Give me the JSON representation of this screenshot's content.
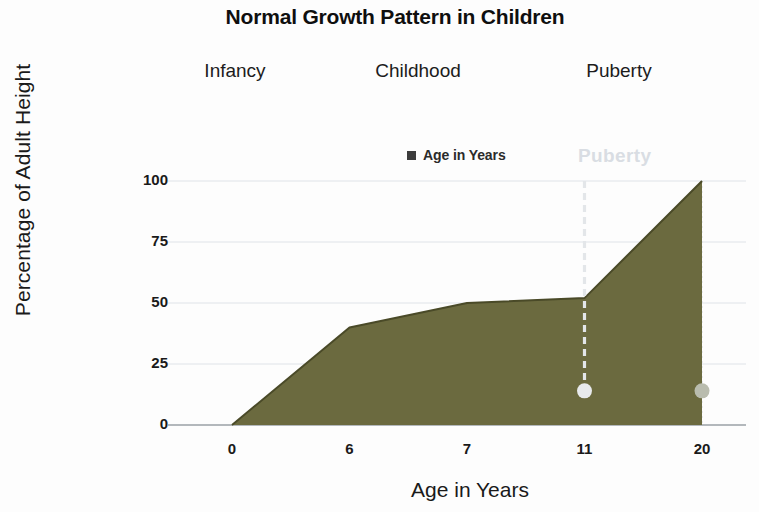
{
  "chart_data": {
    "type": "area",
    "title": "Normal Growth Pattern in Children",
    "xlabel": "Age in Years",
    "ylabel": "Percentage of Adult Height",
    "categories": [
      "0",
      "6",
      "7",
      "11",
      "20"
    ],
    "values": [
      0,
      40,
      50,
      52,
      100
    ],
    "series": [
      {
        "name": "Age in Years",
        "values": [
          0,
          40,
          50,
          52,
          100
        ]
      }
    ],
    "ylim": [
      0,
      100
    ],
    "yticks": [
      "0",
      "25",
      "50",
      "75",
      "100"
    ],
    "ytick_values": [
      0,
      25,
      50,
      75,
      100
    ],
    "grid": true,
    "legend_position": "top-center",
    "legend_entries": [
      "Age in Years"
    ],
    "area_color": "#6b6a3f",
    "line_color": "#4a4a28",
    "grid_color": "#dfe3e8",
    "annotations": [
      {
        "text": "Infancy",
        "kind": "stage-band-label"
      },
      {
        "text": "Childhood",
        "kind": "stage-band-label"
      },
      {
        "text": "Puberty",
        "kind": "stage-band-label"
      },
      {
        "text": "Puberty",
        "kind": "faint-marker-label",
        "color": "#d9dde3"
      }
    ],
    "markers": [
      {
        "category": "11",
        "value": 14,
        "color": "#e8eaec"
      },
      {
        "category": "20",
        "value": 14,
        "color": "#b9bcae"
      }
    ],
    "dashed_marker_line": {
      "category": "11",
      "from": 100,
      "to": 14,
      "color": "#e3e6e9"
    }
  },
  "header": {
    "title": "Normal Growth Pattern in Children"
  },
  "stages": [
    {
      "label": "Infancy"
    },
    {
      "label": "Childhood"
    },
    {
      "label": "Puberty"
    }
  ],
  "legend": {
    "marker_icon": "square-marker-icon",
    "label": "Age in Years"
  },
  "faint_label": {
    "text": "Puberty"
  },
  "axes": {
    "y": {
      "title": "Percentage of Adult Height",
      "ticks": [
        "100",
        "75",
        "50",
        "25",
        "0"
      ]
    },
    "x": {
      "title": "Age in Years",
      "ticks": [
        "0",
        "6",
        "7",
        "11",
        "20"
      ]
    }
  }
}
